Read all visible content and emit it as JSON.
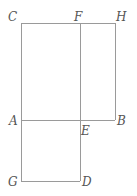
{
  "diagram": {
    "points": {
      "C": {
        "label": "C",
        "x": 21,
        "y": 23
      },
      "F": {
        "label": "F",
        "x": 80,
        "y": 23
      },
      "H": {
        "label": "H",
        "x": 115,
        "y": 23
      },
      "A": {
        "label": "A",
        "x": 21,
        "y": 120
      },
      "E": {
        "label": "E",
        "x": 80,
        "y": 120
      },
      "B": {
        "label": "B",
        "x": 115,
        "y": 120
      },
      "G": {
        "label": "G",
        "x": 21,
        "y": 181
      },
      "D": {
        "label": "D",
        "x": 80,
        "y": 181
      }
    },
    "segments": [
      [
        "C",
        "H"
      ],
      [
        "C",
        "G"
      ],
      [
        "F",
        "D"
      ],
      [
        "H",
        "B"
      ],
      [
        "A",
        "B"
      ],
      [
        "G",
        "D"
      ]
    ],
    "line_color": "#9a9a9a",
    "label_color": "#555555"
  }
}
